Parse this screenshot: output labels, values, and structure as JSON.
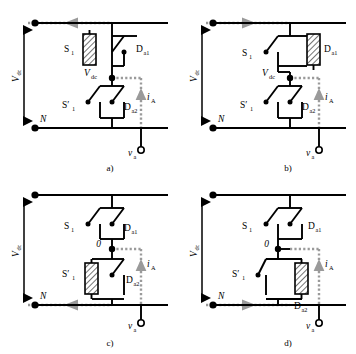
{
  "figure": {
    "colors": {
      "wire": "#000000",
      "current_path": "#8c8c8c",
      "hatch": "#000000",
      "background": "#ffffff"
    }
  },
  "labels": {
    "vdc": "V",
    "vdc_sub": "dc",
    "neutral": "N",
    "zero": "0",
    "s1": "S",
    "s1_sub": "1",
    "s1p": "S′",
    "s1p_sub": "1",
    "da1": "D",
    "da1_sub": "a1",
    "da2": "D",
    "da2_sub": "a2",
    "ia": "i",
    "ia_sub": "A",
    "va": "v",
    "va_sub": "a"
  },
  "panels": [
    {
      "id": "a",
      "caption": "a)",
      "node_label": "vdc",
      "node_label_text": "V",
      "node_label_sub": "dc",
      "conducting_device": "S1",
      "s1_state": "hatched",
      "s1p_state": "open",
      "da1_state": "open",
      "da2_state": "open",
      "current_rail": "top",
      "rail_arrow_direction": "right",
      "ia_direction": "down",
      "current_path": "top-rail-through-S1-to-output"
    },
    {
      "id": "b",
      "caption": "b)",
      "node_label": "vdc",
      "node_label_text": "V",
      "node_label_sub": "dc",
      "conducting_device": "Da1",
      "s1_state": "open",
      "s1p_state": "open",
      "da1_state": "hatched",
      "da2_state": "open",
      "current_rail": "top",
      "rail_arrow_direction": "left",
      "ia_direction": "up",
      "current_path": "output-through-Da1-to-top-rail"
    },
    {
      "id": "c",
      "caption": "c)",
      "node_label": "zero",
      "node_label_text": "0",
      "node_label_sub": "",
      "conducting_device": "S1p",
      "s1_state": "open",
      "s1p_state": "hatched",
      "da1_state": "open",
      "da2_state": "open",
      "current_rail": "bottom",
      "rail_arrow_direction": "right",
      "ia_direction": "down",
      "current_path": "bottom-rail-through-S1prime-to-output"
    },
    {
      "id": "d",
      "caption": "d)",
      "node_label": "zero",
      "node_label_text": "0",
      "node_label_sub": "",
      "conducting_device": "Da2",
      "s1_state": "open",
      "s1p_state": "open",
      "da1_state": "open",
      "da2_state": "hatched",
      "current_rail": "bottom",
      "rail_arrow_direction": "left",
      "ia_direction": "up",
      "current_path": "output-through-Da2-to-bottom-rail"
    }
  ]
}
